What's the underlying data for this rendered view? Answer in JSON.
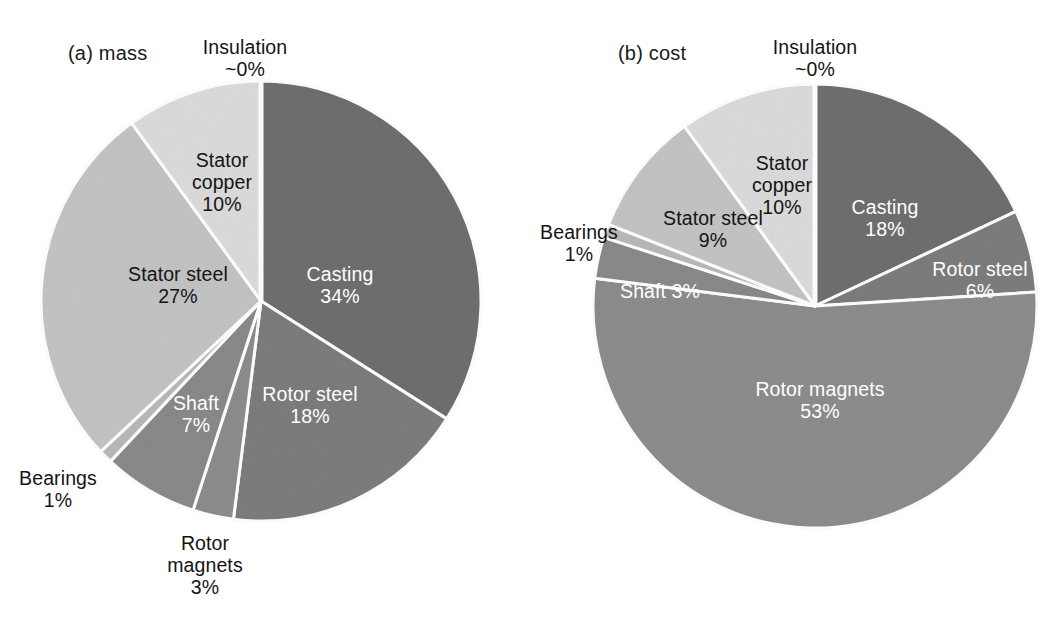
{
  "figure": {
    "background": "#ffffff",
    "panels": [
      "a",
      "b"
    ]
  },
  "panel_a": {
    "caption": "(a) mass"
  },
  "panel_b": {
    "caption": "(b) cost"
  },
  "labels": {
    "a": {
      "insulation": "Insulation\n~0%",
      "stator_copper": "Stator\ncopper\n10%",
      "casting": "Casting\n34%",
      "rotor_steel": "Rotor steel\n18%",
      "rotor_magnets": "Rotor\nmagnets\n3%",
      "shaft": "Shaft\n7%",
      "bearings": "Bearings\n1%",
      "stator_steel": "Stator steel\n27%"
    },
    "b": {
      "insulation": "Insulation\n~0%",
      "stator_copper": "Stator\ncopper\n10%",
      "casting": "Casting\n18%",
      "rotor_steel": "Rotor steel\n6%",
      "rotor_magnets": "Rotor magnets\n53%",
      "shaft": "Shaft 3%",
      "bearings": "Bearings\n1%",
      "stator_steel": "Stator steel\n9%"
    }
  },
  "colors": {
    "casting": "#6f6f6f",
    "rotor_steel": "#7d7d7d",
    "rotor_magnets": "#8d8d8d",
    "shaft": "#8a8a8a",
    "bearings": "#b9b9b9",
    "stator_steel": "#c4c4c4",
    "stator_copper": "#dcdcdc",
    "insulation": "#f2f2f2",
    "slice_border": "#ffffff",
    "label_dark": "#141414",
    "label_light": "#ffffff"
  },
  "chart_data": [
    {
      "type": "pie",
      "title": "(a) mass",
      "id": "mass",
      "unit": "percent",
      "start_angle_deg": 0,
      "direction": "clockwise",
      "center": [
        261,
        301
      ],
      "radius": 220,
      "categories": [
        "Insulation",
        "Casting",
        "Rotor steel",
        "Rotor magnets",
        "Shaft",
        "Bearings",
        "Stator steel",
        "Stator copper"
      ],
      "values": [
        0,
        34,
        18,
        3,
        7,
        1,
        27,
        10
      ],
      "value_labels": [
        "~0%",
        "34%",
        "18%",
        "3%",
        "7%",
        "1%",
        "27%",
        "10%"
      ],
      "legend": "none",
      "grid": false
    },
    {
      "type": "pie",
      "title": "(b) cost",
      "id": "cost",
      "unit": "percent",
      "start_angle_deg": 0,
      "direction": "clockwise",
      "center": [
        285,
        306
      ],
      "radius": 222,
      "categories": [
        "Insulation",
        "Casting",
        "Rotor steel",
        "Rotor magnets",
        "Shaft",
        "Bearings",
        "Stator steel",
        "Stator copper"
      ],
      "values": [
        0,
        18,
        6,
        53,
        3,
        1,
        9,
        10
      ],
      "value_labels": [
        "~0%",
        "18%",
        "6%",
        "53%",
        "3%",
        "1%",
        "9%",
        "10%"
      ],
      "legend": "none",
      "grid": false
    }
  ]
}
